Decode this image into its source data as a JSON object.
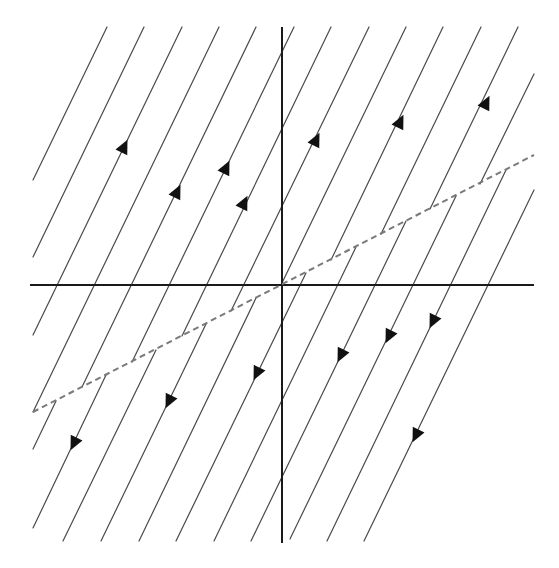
{
  "diagram": {
    "type": "phase-portrait",
    "colors": {
      "background": "#ffffff",
      "trajectory": "#4a4a4a",
      "axis": "#1a1a1a",
      "switching_line": "#7a7a7a",
      "arrow": "#111111"
    },
    "axes": {
      "horizontal": {
        "x1": 30,
        "y1": 285,
        "x2": 534,
        "y2": 285
      },
      "vertical": {
        "x1": 282,
        "y1": 27,
        "x2": 282,
        "y2": 543
      }
    },
    "switching_line": {
      "x1": 33,
      "y1": 412,
      "x2": 534,
      "y2": 155,
      "style": "dashed"
    },
    "upper_trajectories": [
      {
        "x1": 107,
        "y1": 27,
        "x2": 33,
        "y2": 180
      },
      {
        "x1": 144,
        "y1": 27,
        "x2": 33,
        "y2": 257
      },
      {
        "x1": 182,
        "y1": 27,
        "x2": 33,
        "y2": 335
      },
      {
        "x1": 219,
        "y1": 27,
        "x2": 33,
        "y2": 412
      },
      {
        "x1": 256,
        "y1": 27,
        "x2": 82,
        "y2": 387
      },
      {
        "x1": 294,
        "y1": 27,
        "x2": 132,
        "y2": 362
      },
      {
        "x1": 331,
        "y1": 27,
        "x2": 182,
        "y2": 336
      },
      {
        "x1": 369,
        "y1": 27,
        "x2": 231,
        "y2": 311
      },
      {
        "x1": 406,
        "y1": 27,
        "x2": 281,
        "y2": 285
      },
      {
        "x1": 443,
        "y1": 27,
        "x2": 331,
        "y2": 260
      },
      {
        "x1": 481,
        "y1": 27,
        "x2": 381,
        "y2": 234
      },
      {
        "x1": 518,
        "y1": 27,
        "x2": 430,
        "y2": 209
      },
      {
        "x1": 534,
        "y1": 74,
        "x2": 480,
        "y2": 184
      }
    ],
    "lower_trajectories": [
      {
        "x1": 56,
        "y1": 401,
        "x2": 33,
        "y2": 449
      },
      {
        "x1": 106,
        "y1": 375,
        "x2": 33,
        "y2": 528
      },
      {
        "x1": 156,
        "y1": 350,
        "x2": 63,
        "y2": 541
      },
      {
        "x1": 206,
        "y1": 324,
        "x2": 101,
        "y2": 541
      },
      {
        "x1": 256,
        "y1": 298,
        "x2": 139,
        "y2": 541
      },
      {
        "x1": 306,
        "y1": 273,
        "x2": 176,
        "y2": 541
      },
      {
        "x1": 356,
        "y1": 247,
        "x2": 214,
        "y2": 541
      },
      {
        "x1": 406,
        "y1": 221,
        "x2": 251,
        "y2": 541
      },
      {
        "x1": 456,
        "y1": 196,
        "x2": 290,
        "y2": 539
      },
      {
        "x1": 506,
        "y1": 170,
        "x2": 327,
        "y2": 541
      },
      {
        "x1": 534,
        "y1": 190,
        "x2": 364,
        "y2": 541
      }
    ],
    "arrows_up": [
      {
        "x": 124,
        "y": 147
      },
      {
        "x": 177,
        "y": 192
      },
      {
        "x": 226,
        "y": 168
      },
      {
        "x": 244,
        "y": 203
      },
      {
        "x": 316,
        "y": 140
      },
      {
        "x": 400,
        "y": 122
      },
      {
        "x": 486,
        "y": 103
      }
    ],
    "arrows_down": [
      {
        "x": 74,
        "y": 443
      },
      {
        "x": 169,
        "y": 401
      },
      {
        "x": 257,
        "y": 373
      },
      {
        "x": 341,
        "y": 355
      },
      {
        "x": 389,
        "y": 336
      },
      {
        "x": 433,
        "y": 321
      },
      {
        "x": 416,
        "y": 435
      }
    ],
    "flow_direction": {
      "above_switching_line": "up-right",
      "below_switching_line": "down-left"
    },
    "trajectory_slope_px": 2.07
  }
}
